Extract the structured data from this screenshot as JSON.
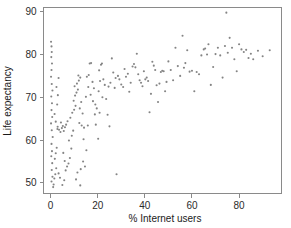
{
  "chart_data": {
    "type": "scatter",
    "title": "",
    "xlabel": "% Internet users",
    "ylabel": "Life expectancy",
    "xlim": [
      -3,
      98
    ],
    "ylim": [
      47.5,
      91
    ],
    "xticks": [
      0,
      20,
      40,
      60,
      80
    ],
    "yticks": [
      50,
      60,
      70,
      80,
      90
    ],
    "xtick_labels": [
      "0",
      "20",
      "40",
      "60",
      "80"
    ],
    "ytick_labels": [
      "50",
      "60",
      "70",
      "80",
      "90"
    ],
    "grid": false,
    "legend": null,
    "marker": {
      "shape": "circle",
      "color": "#7d7d7d",
      "size_px": 2.1,
      "opacity": 0.95
    },
    "frame": {
      "color": "#8a8a8a",
      "box": true
    },
    "n_points": 188,
    "points": [
      [
        0.2,
        83.0
      ],
      [
        0.4,
        81.9
      ],
      [
        0.5,
        80.6
      ],
      [
        0.3,
        79.4
      ],
      [
        0.6,
        77.9
      ],
      [
        0.4,
        76.4
      ],
      [
        0.2,
        74.8
      ],
      [
        0.5,
        73.1
      ],
      [
        0.8,
        71.6
      ],
      [
        0.3,
        70.2
      ],
      [
        0.6,
        68.6
      ],
      [
        0.4,
        67.0
      ],
      [
        0.7,
        65.4
      ],
      [
        0.2,
        63.9
      ],
      [
        0.5,
        62.3
      ],
      [
        0.9,
        60.7
      ],
      [
        0.4,
        59.1
      ],
      [
        0.6,
        57.4
      ],
      [
        0.3,
        56.2
      ],
      [
        0.7,
        54.6
      ],
      [
        0.5,
        53.0
      ],
      [
        0.8,
        51.4
      ],
      [
        0.4,
        50.3
      ],
      [
        1.1,
        49.0
      ],
      [
        1.3,
        49.6
      ],
      [
        1.6,
        51.0
      ],
      [
        2.0,
        52.0
      ],
      [
        2.4,
        53.4
      ],
      [
        1.8,
        55.6
      ],
      [
        2.2,
        56.9
      ],
      [
        2.6,
        58.2
      ],
      [
        2.9,
        62.6
      ],
      [
        2.2,
        64.3
      ],
      [
        1.7,
        66.1
      ],
      [
        2.8,
        68.3
      ],
      [
        3.1,
        70.5
      ],
      [
        2.5,
        72.4
      ],
      [
        3.4,
        74.5
      ],
      [
        3.0,
        63.1
      ],
      [
        3.6,
        62.4
      ],
      [
        4.2,
        61.9
      ],
      [
        4.8,
        62.8
      ],
      [
        5.2,
        63.3
      ],
      [
        4.4,
        64.1
      ],
      [
        5.6,
        62.1
      ],
      [
        6.1,
        63.0
      ],
      [
        6.6,
        63.6
      ],
      [
        7.2,
        64.4
      ],
      [
        5.0,
        49.5
      ],
      [
        5.8,
        50.6
      ],
      [
        4.0,
        51.2
      ],
      [
        3.4,
        52.2
      ],
      [
        6.4,
        52.9
      ],
      [
        7.0,
        53.8
      ],
      [
        7.6,
        54.5
      ],
      [
        6.0,
        55.1
      ],
      [
        8.2,
        55.8
      ],
      [
        5.4,
        57.0
      ],
      [
        8.8,
        58.0
      ],
      [
        7.8,
        59.9
      ],
      [
        9.0,
        61.0
      ],
      [
        9.6,
        62.2
      ],
      [
        8.4,
        65.2
      ],
      [
        9.2,
        66.4
      ],
      [
        10.0,
        67.1
      ],
      [
        10.6,
        68.0
      ],
      [
        9.8,
        69.2
      ],
      [
        10.4,
        70.4
      ],
      [
        11.0,
        71.1
      ],
      [
        11.6,
        71.8
      ],
      [
        10.2,
        72.6
      ],
      [
        11.2,
        73.2
      ],
      [
        12.0,
        73.9
      ],
      [
        12.6,
        74.6
      ],
      [
        11.8,
        75.1
      ],
      [
        12.4,
        67.4
      ],
      [
        13.0,
        68.9
      ],
      [
        13.6,
        66.2
      ],
      [
        12.2,
        64.0
      ],
      [
        13.2,
        63.4
      ],
      [
        14.0,
        60.2
      ],
      [
        13.8,
        55.0
      ],
      [
        12.8,
        53.2
      ],
      [
        11.4,
        52.4
      ],
      [
        10.8,
        50.8
      ],
      [
        12.6,
        49.4
      ],
      [
        14.6,
        53.8
      ],
      [
        15.2,
        57.6
      ],
      [
        14.2,
        62.9
      ],
      [
        15.8,
        63.4
      ],
      [
        15.0,
        70.1
      ],
      [
        16.0,
        72.4
      ],
      [
        15.4,
        74.8
      ],
      [
        16.6,
        77.9
      ],
      [
        17.2,
        78.0
      ],
      [
        16.2,
        75.2
      ],
      [
        17.8,
        73.6
      ],
      [
        18.4,
        72.1
      ],
      [
        17.0,
        70.6
      ],
      [
        18.0,
        69.1
      ],
      [
        19.0,
        68.3
      ],
      [
        19.6,
        67.4
      ],
      [
        18.8,
        66.0
      ],
      [
        19.2,
        63.6
      ],
      [
        20.2,
        60.3
      ],
      [
        20.8,
        66.4
      ],
      [
        20.4,
        71.4
      ],
      [
        21.0,
        73.8
      ],
      [
        20.6,
        76.3
      ],
      [
        21.4,
        77.6
      ],
      [
        21.8,
        77.9
      ],
      [
        22.4,
        74.2
      ],
      [
        23.0,
        72.9
      ],
      [
        22.0,
        70.0
      ],
      [
        23.6,
        69.6
      ],
      [
        24.2,
        65.9
      ],
      [
        25.0,
        63.2
      ],
      [
        24.6,
        72.5
      ],
      [
        25.4,
        73.4
      ],
      [
        26.0,
        79.1
      ],
      [
        26.6,
        75.8
      ],
      [
        27.2,
        72.2
      ],
      [
        28.0,
        52.0
      ],
      [
        27.6,
        74.5
      ],
      [
        28.6,
        75.0
      ],
      [
        29.2,
        74.2
      ],
      [
        30.0,
        73.0
      ],
      [
        30.8,
        72.4
      ],
      [
        31.4,
        76.6
      ],
      [
        32.0,
        74.8
      ],
      [
        32.8,
        75.5
      ],
      [
        33.4,
        71.3
      ],
      [
        34.0,
        73.4
      ],
      [
        34.8,
        77.2
      ],
      [
        35.4,
        77.8
      ],
      [
        36.0,
        77.0
      ],
      [
        36.6,
        80.2
      ],
      [
        37.2,
        75.4
      ],
      [
        37.8,
        74.0
      ],
      [
        38.4,
        73.4
      ],
      [
        39.0,
        72.6
      ],
      [
        39.6,
        76.1
      ],
      [
        40.2,
        74.2
      ],
      [
        40.8,
        74.6
      ],
      [
        41.4,
        73.8
      ],
      [
        42.0,
        66.5
      ],
      [
        42.6,
        70.8
      ],
      [
        43.2,
        78.3
      ],
      [
        43.8,
        77.4
      ],
      [
        44.4,
        76.4
      ],
      [
        45.0,
        72.8
      ],
      [
        45.6,
        68.9
      ],
      [
        46.2,
        73.2
      ],
      [
        46.8,
        75.9
      ],
      [
        47.4,
        76.2
      ],
      [
        48.0,
        76.1
      ],
      [
        48.6,
        71.4
      ],
      [
        49.2,
        73.6
      ],
      [
        50.0,
        78.4
      ],
      [
        51.0,
        76.4
      ],
      [
        52.0,
        74.0
      ],
      [
        53.0,
        81.6
      ],
      [
        54.0,
        77.3
      ],
      [
        55.0,
        75.0
      ],
      [
        56.0,
        84.4
      ],
      [
        56.6,
        76.9
      ],
      [
        57.2,
        78.0
      ],
      [
        58.0,
        81.0
      ],
      [
        59.0,
        76.0
      ],
      [
        60.0,
        76.2
      ],
      [
        61.0,
        71.4
      ],
      [
        62.0,
        75.9
      ],
      [
        63.0,
        75.4
      ],
      [
        64.0,
        79.8
      ],
      [
        65.0,
        81.2
      ],
      [
        65.6,
        81.4
      ],
      [
        66.4,
        80.0
      ],
      [
        67.0,
        82.4
      ],
      [
        68.0,
        72.9
      ],
      [
        69.0,
        77.1
      ],
      [
        70.0,
        80.1
      ],
      [
        71.0,
        81.6
      ],
      [
        72.0,
        79.8
      ],
      [
        73.0,
        74.6
      ],
      [
        74.0,
        82.0
      ],
      [
        74.6,
        89.8
      ],
      [
        75.2,
        80.4
      ],
      [
        76.0,
        83.9
      ],
      [
        77.0,
        81.6
      ],
      [
        78.0,
        78.9
      ],
      [
        79.0,
        76.1
      ],
      [
        80.0,
        82.4
      ],
      [
        81.0,
        81.2
      ],
      [
        82.0,
        80.6
      ],
      [
        83.0,
        81.1
      ],
      [
        84.0,
        79.2
      ],
      [
        85.0,
        80.2
      ],
      [
        86.0,
        78.9
      ],
      [
        88.0,
        80.9
      ],
      [
        90.0,
        79.6
      ],
      [
        93.0,
        81.0
      ]
    ]
  }
}
